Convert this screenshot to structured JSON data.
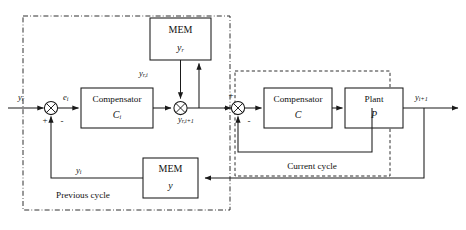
{
  "diagram": {
    "background": "#ffffff",
    "line_color": "#1a1a1a"
  },
  "regions": [
    {
      "id": "previous-cycle",
      "label": "Previous cycle",
      "border": "dash-dot"
    },
    {
      "id": "current-cycle",
      "label": "Current cycle",
      "border": "dashed"
    }
  ],
  "blocks": [
    {
      "id": "mem-upper",
      "line1": "MEM",
      "line2": "y",
      "sub2": "r",
      "type": "memory"
    },
    {
      "id": "mem-lower",
      "line1": "MEM",
      "line2": "y",
      "sub2": "",
      "type": "memory"
    },
    {
      "id": "compensator-prev",
      "line1": "Compensator",
      "line2": "C",
      "sub2": "i",
      "type": "compensator"
    },
    {
      "id": "compensator-curr",
      "line1": "Compensator",
      "line2": "C",
      "sub2": "",
      "type": "compensator"
    },
    {
      "id": "plant",
      "line1": "Plant",
      "line2": "P",
      "sub2": "",
      "type": "plant"
    }
  ],
  "signals": {
    "input_ref": {
      "base": "y",
      "sub": "r"
    },
    "error_prev": {
      "base": "e",
      "sub": "i"
    },
    "mem_ref_out": {
      "base": "y",
      "sub": "r,i"
    },
    "sum_ref_next": {
      "base": "y",
      "sub": "r,i+1"
    },
    "feedback_prev": {
      "base": "y",
      "sub": "i"
    },
    "output_next": {
      "base": "y",
      "sub": "i+1"
    }
  },
  "signs": {
    "sum_prev_plus": "+",
    "sum_prev_minus": "-",
    "sum_curr_plus": "+",
    "sum_curr_minus": "-"
  }
}
